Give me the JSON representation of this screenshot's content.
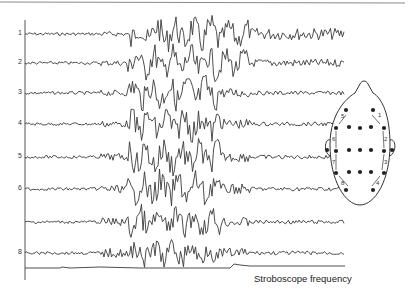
{
  "figure": {
    "channels": [
      {
        "label": "1",
        "y": 34
      },
      {
        "label": "2",
        "y": 63
      },
      {
        "label": "3",
        "y": 93
      },
      {
        "label": "4",
        "y": 124
      },
      {
        "label": "5",
        "y": 157
      },
      {
        "label": "6",
        "y": 189
      },
      {
        "label": "",
        "y": 222
      },
      {
        "label": "8",
        "y": 253
      }
    ],
    "strobe_label": "Stroboscope frequency",
    "head_diagram": {
      "electrode_labels": [
        "1",
        "2",
        "3",
        "4",
        "5",
        "6",
        "7",
        "8"
      ]
    },
    "colors": {
      "trace": "#3a3a3a",
      "background": "#ffffff"
    }
  }
}
